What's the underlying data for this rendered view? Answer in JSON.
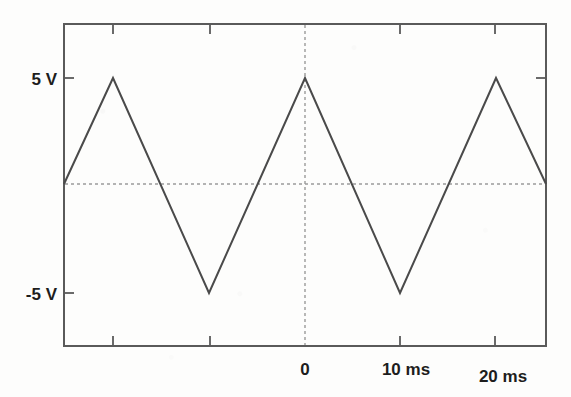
{
  "chart_data": {
    "type": "line",
    "title": "",
    "subtitle": "",
    "xlabel": "",
    "ylabel": "",
    "waveform": "triangle",
    "amplitude_v": 5,
    "period_ms": 10,
    "xlim": [
      -25.4,
      25.4
    ],
    "ylim": [
      -7.6,
      7.6
    ],
    "grid": false,
    "legend": null,
    "y_ticks": [
      {
        "value": 5,
        "label": "5 V"
      },
      {
        "value": -5,
        "label": "-5 V"
      }
    ],
    "x_ticks": [
      {
        "value": -20,
        "label": ""
      },
      {
        "value": -10,
        "label": ""
      },
      {
        "value": 0,
        "label": "0"
      },
      {
        "value": 10,
        "label": "10 ms"
      },
      {
        "value": 20,
        "label": "20 ms"
      }
    ],
    "reference_lines": [
      {
        "name": "zero-volt-line",
        "axis": "horizontal",
        "value": 0,
        "style": "dotted"
      },
      {
        "name": "time-zero-line",
        "axis": "vertical",
        "value": 0,
        "style": "dotted"
      }
    ],
    "x": [
      -25.4,
      -20.0,
      -15.0,
      -10.0,
      -5.0,
      0.0,
      5.0,
      10.0,
      15.0,
      20.0,
      25.4
    ],
    "y": [
      0.0,
      5.0,
      -5.0,
      5.0,
      -5.0,
      5.0,
      -5.0,
      5.0,
      -5.0,
      5.0,
      0.0
    ],
    "points_px": [
      [
        64,
        184
      ],
      [
        113,
        78
      ],
      [
        209,
        293
      ],
      [
        305,
        78
      ],
      [
        400,
        293
      ],
      [
        496,
        78
      ],
      [
        546,
        184
      ]
    ],
    "series": [
      {
        "name": "triangle-wave",
        "x": [
          -25.4,
          -20.0,
          -10.0,
          0.0,
          10.0,
          20.0,
          25.4
        ],
        "values": [
          0.0,
          5.0,
          -5.0,
          5.0,
          -5.0,
          5.0,
          0.0
        ]
      }
    ],
    "colors": {
      "trace": "#4a4a4a",
      "frame": "#5a5a5a",
      "guide": "#9a9a9a",
      "text": "#1d1d1d",
      "background": "#fdfdfc"
    }
  }
}
